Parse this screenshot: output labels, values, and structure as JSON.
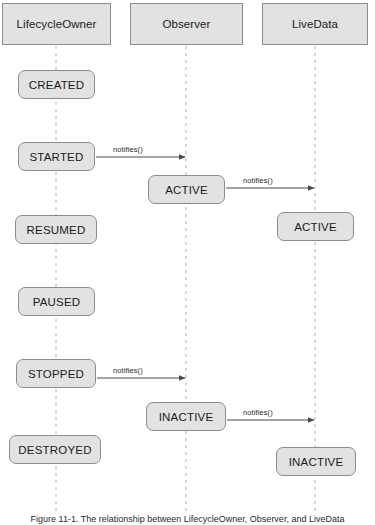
{
  "diagram": {
    "caption": "Figure 11-1. The relationship between LifecycleOwner, Observer, and LiveData",
    "colors": {
      "box_fill": "#e2e2e2",
      "box_border": "#8d8d8d",
      "lifeline": "#c9a6a6",
      "arrow": "#4a4a4a",
      "text": "#1b1b1b",
      "background": "#ffffff"
    },
    "lifelines": [
      {
        "id": "lifecycleowner",
        "label": "LifecycleOwner",
        "x": 56
      },
      {
        "id": "observer",
        "label": "Observer",
        "x": 186
      },
      {
        "id": "livedata",
        "label": "LiveData",
        "x": 315
      }
    ],
    "headers": [
      {
        "id": "header-lifecycleowner",
        "label": "LifecycleOwner",
        "x": 2,
        "y": 3,
        "w": 109,
        "h": 42
      },
      {
        "id": "header-observer",
        "label": "Observer",
        "x": 130,
        "y": 3,
        "w": 113,
        "h": 42
      },
      {
        "id": "header-livedata",
        "label": "LiveData",
        "x": 262,
        "y": 3,
        "w": 106,
        "h": 42
      }
    ],
    "states": [
      {
        "id": "state-created",
        "lane": "lifecycleowner",
        "label": "CREATED",
        "x": 18,
        "y": 70,
        "w": 77,
        "h": 29
      },
      {
        "id": "state-started",
        "lane": "lifecycleowner",
        "label": "STARTED",
        "x": 18,
        "y": 142,
        "w": 77,
        "h": 29
      },
      {
        "id": "state-observer-active",
        "lane": "observer",
        "label": "ACTIVE",
        "x": 148,
        "y": 175,
        "w": 77,
        "h": 29
      },
      {
        "id": "state-livedata-active",
        "lane": "livedata",
        "label": "ACTIVE",
        "x": 277,
        "y": 212,
        "w": 77,
        "h": 29
      },
      {
        "id": "state-resumed",
        "lane": "lifecycleowner",
        "label": "RESUMED",
        "x": 15,
        "y": 215,
        "w": 82,
        "h": 29
      },
      {
        "id": "state-paused",
        "lane": "lifecycleowner",
        "label": "PAUSED",
        "x": 18,
        "y": 287,
        "w": 77,
        "h": 29
      },
      {
        "id": "state-stopped",
        "lane": "lifecycleowner",
        "label": "STOPPED",
        "x": 16,
        "y": 359,
        "w": 80,
        "h": 29
      },
      {
        "id": "state-observer-inactive",
        "lane": "observer",
        "label": "INACTIVE",
        "x": 146,
        "y": 402,
        "w": 80,
        "h": 29
      },
      {
        "id": "state-livedata-inactive",
        "lane": "livedata",
        "label": "INACTIVE",
        "x": 276,
        "y": 447,
        "w": 80,
        "h": 29
      },
      {
        "id": "state-destroyed",
        "lane": "lifecycleowner",
        "label": "DESTROYED",
        "x": 9,
        "y": 435,
        "w": 92,
        "h": 29
      }
    ],
    "messages": [
      {
        "id": "msg-started-observer",
        "label": "notifies()",
        "from": "lifecycleowner",
        "to": "observer",
        "x1": 96,
        "x2": 185,
        "y": 157,
        "label_x": 113,
        "label_y": 149
      },
      {
        "id": "msg-observer-livedata",
        "label": "notifies()",
        "from": "observer",
        "to": "livedata",
        "x1": 226,
        "x2": 314,
        "y": 188,
        "label_x": 243,
        "label_y": 180
      },
      {
        "id": "msg-stopped-observer",
        "label": "notifies()",
        "from": "lifecycleowner",
        "to": "observer",
        "x1": 97,
        "x2": 185,
        "y": 378,
        "label_x": 113,
        "label_y": 370
      },
      {
        "id": "msg-inactive-livedata",
        "label": "notifies()",
        "from": "observer",
        "to": "livedata",
        "x1": 227,
        "x2": 314,
        "y": 420,
        "label_x": 243,
        "label_y": 412
      }
    ]
  }
}
